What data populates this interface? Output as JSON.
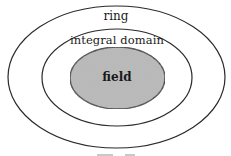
{
  "diagram": {
    "type": "nested-ellipse-venn",
    "colors": {
      "background": "#ffffff",
      "stroke": "#2a2a2a",
      "field_fill": "#b9b9b9"
    },
    "regions": [
      {
        "id": "ring",
        "label": "ring",
        "cx": 116.5,
        "cy": 77,
        "rx": 108.5,
        "ry": 71,
        "fill": "none"
      },
      {
        "id": "integral-domain",
        "label": "integral domain",
        "cx": 117,
        "cy": 77.5,
        "rx": 75,
        "ry": 48.5,
        "fill": "none"
      },
      {
        "id": "field",
        "label": "field",
        "cx": 117.5,
        "cy": 78,
        "rx": 47.5,
        "ry": 31,
        "fill": "#b9b9b9"
      }
    ],
    "labels": {
      "ring": "ring",
      "integral_domain": "integral domain",
      "field": "field"
    }
  }
}
